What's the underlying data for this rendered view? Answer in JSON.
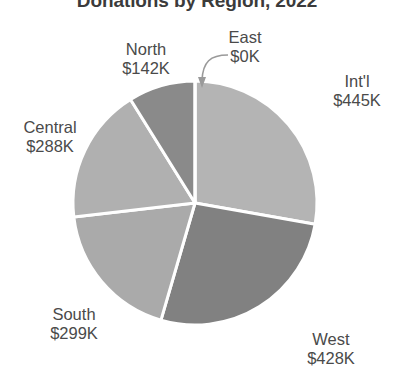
{
  "chart_data": {
    "type": "pie",
    "title": "Donations by Region, 2022",
    "xlabel": "",
    "ylabel": "",
    "unit": "K",
    "currency": "$",
    "total": 1602,
    "legend_position": "none",
    "grid": false,
    "start_angle_deg": 0,
    "direction": "clockwise",
    "categories": [
      "East",
      "Int'l",
      "West",
      "South",
      "Central",
      "North"
    ],
    "values": [
      0,
      445,
      428,
      299,
      288,
      142
    ],
    "labels": [
      "$0K",
      "$445K",
      "$428K",
      "$299K",
      "$288K",
      "$142K"
    ],
    "slices": [
      {
        "name": "East",
        "value": 0,
        "value_label": "$0K",
        "color": "#b4b4b4",
        "angle_deg": 0,
        "start_deg": 0,
        "end_deg": 0,
        "percent": 0.0,
        "has_leader_arrow": true
      },
      {
        "name": "Int'l",
        "value": 445,
        "value_label": "$445K",
        "color": "#b4b4b4",
        "angle_deg": 100.0,
        "start_deg": 0,
        "end_deg": 100.0,
        "percent": 27.8,
        "has_leader_arrow": false
      },
      {
        "name": "West",
        "value": 428,
        "value_label": "$428K",
        "color": "#818181",
        "angle_deg": 96.2,
        "start_deg": 100.0,
        "end_deg": 196.2,
        "percent": 26.7,
        "has_leader_arrow": false
      },
      {
        "name": "South",
        "value": 299,
        "value_label": "$299K",
        "color": "#aaaaaa",
        "angle_deg": 67.2,
        "start_deg": 196.2,
        "end_deg": 263.4,
        "percent": 18.7,
        "has_leader_arrow": false
      },
      {
        "name": "Central",
        "value": 288,
        "value_label": "$288K",
        "color": "#b0b0b0",
        "angle_deg": 64.7,
        "start_deg": 263.4,
        "end_deg": 328.1,
        "percent": 18.0,
        "has_leader_arrow": false
      },
      {
        "name": "North",
        "value": 142,
        "value_label": "$142K",
        "color": "#8a8a8a",
        "angle_deg": 31.9,
        "start_deg": 328.1,
        "end_deg": 360.0,
        "percent": 8.9,
        "has_leader_arrow": false
      }
    ],
    "geometry": {
      "center_x": 195,
      "center_y": 203,
      "radius": 122,
      "separator_color": "#ffffff",
      "separator_width": 3
    },
    "colors": {
      "background": "#ffffff",
      "title": "#3b3b3b",
      "label": "#4a4a4a",
      "arrow": "#9a9a9a"
    }
  }
}
